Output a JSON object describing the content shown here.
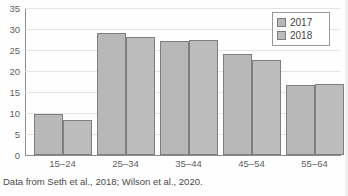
{
  "figure": {
    "caption": "Data from Seth et al., 2018; Wilson et al., 2020.",
    "cropped_title": ""
  },
  "legend": {
    "position": "top-right",
    "entries": [
      {
        "label": "2017",
        "color": "#b8b8b8"
      },
      {
        "label": "2018",
        "color": "#bcbcbc"
      }
    ]
  },
  "axis": {
    "y_ticks": [
      "0",
      "5",
      "10",
      "15",
      "20",
      "25",
      "30",
      "35"
    ]
  },
  "chart_data": {
    "type": "bar",
    "title": "",
    "xlabel": "",
    "ylabel": "",
    "ylim": [
      0,
      35
    ],
    "grid": true,
    "legend_position": "top-right",
    "categories": [
      "15–24",
      "25–34",
      "35–44",
      "45–54",
      "55–64"
    ],
    "series": [
      {
        "name": "2017",
        "values": [
          9.7,
          29.0,
          27.2,
          24.0,
          16.6
        ]
      },
      {
        "name": "2018",
        "values": [
          8.4,
          28.0,
          27.5,
          22.7,
          16.8
        ]
      }
    ],
    "yticks": [
      0,
      5,
      10,
      15,
      20,
      25,
      30,
      35
    ],
    "source_note": "Data from Seth et al., 2018; Wilson et al., 2020."
  }
}
